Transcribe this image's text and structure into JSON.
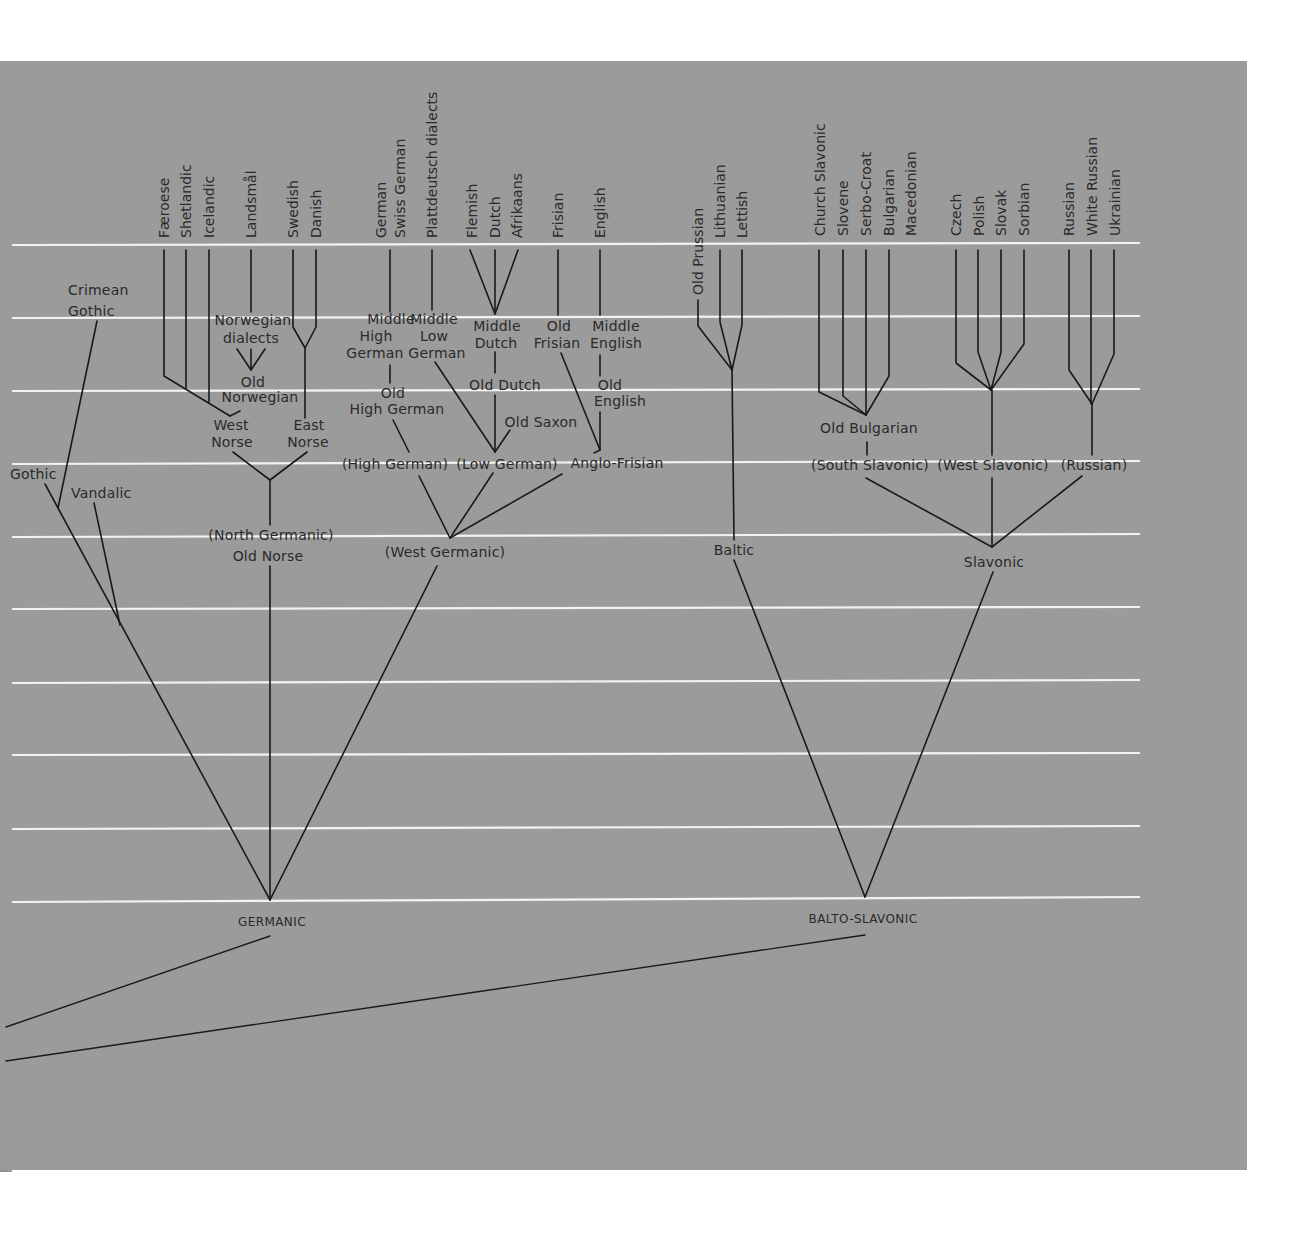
{
  "diagram": {
    "colors": {
      "background": "#9b9b9b",
      "grid": "#f2f2f2",
      "ink": "#1a1a1a",
      "margin": "#ffffff"
    },
    "modern_languages": {
      "north_germanic": [
        "Færoese",
        "Shetlandic",
        "Icelandic",
        "Landsmål",
        "Swedish",
        "Danish"
      ],
      "west_germanic": [
        "German",
        "Swiss German",
        "Plattdeutsch dialects",
        "Flemish",
        "Dutch",
        "Afrikaans",
        "Frisian",
        "English"
      ],
      "baltic": [
        "Old Prussian",
        "Lithuanian",
        "Lettish"
      ],
      "south_slavonic": [
        "Church Slavonic",
        "Slovene",
        "Serbo-Croat",
        "Bulgarian",
        "Macedonian"
      ],
      "west_slavonic": [
        "Czech",
        "Polish",
        "Slovak",
        "Sorbian"
      ],
      "russian": [
        "Russian",
        "White Russian",
        "Ukrainian"
      ]
    },
    "nodes": {
      "crimean_gothic": [
        "Crimean",
        "Gothic"
      ],
      "gothic": "Gothic",
      "vandalic": "Vandalic",
      "norwegian_dialects": [
        "Norwegian",
        "dialects"
      ],
      "old_norwegian": [
        "Old",
        "Norwegian"
      ],
      "west_norse": [
        "West",
        "Norse"
      ],
      "east_norse": [
        "East",
        "Norse"
      ],
      "north_germanic": "(North Germanic)",
      "old_norse": "Old Norse",
      "middle_high_german": [
        "Middle",
        "High",
        "German"
      ],
      "middle_low_german": [
        "Middle",
        "Low",
        "German"
      ],
      "middle_dutch": [
        "Middle",
        "Dutch"
      ],
      "old_frisian": [
        "Old",
        "Frisian"
      ],
      "middle_english": [
        "Middle",
        "English"
      ],
      "old_high_german": [
        "Old",
        "High German"
      ],
      "old_dutch": "Old Dutch",
      "old_english": [
        "Old",
        "English"
      ],
      "old_saxon": "Old Saxon",
      "high_german": "(High German)",
      "low_german": "(Low German)",
      "anglo_frisian": "Anglo-Frisian",
      "west_germanic": "(West Germanic)",
      "old_bulgarian": "Old Bulgarian",
      "south_slavonic": "(South Slavonic)",
      "west_slavonic": "(West Slavonic)",
      "russian_group": "(Russian)",
      "baltic": "Baltic",
      "slavonic": "Slavonic",
      "germanic": "GERMANIC",
      "balto_slavonic": "BALTO-SLAVONIC"
    },
    "grid_lines_y": [
      245,
      318,
      391,
      464,
      537,
      609,
      682,
      754,
      828,
      900
    ]
  }
}
